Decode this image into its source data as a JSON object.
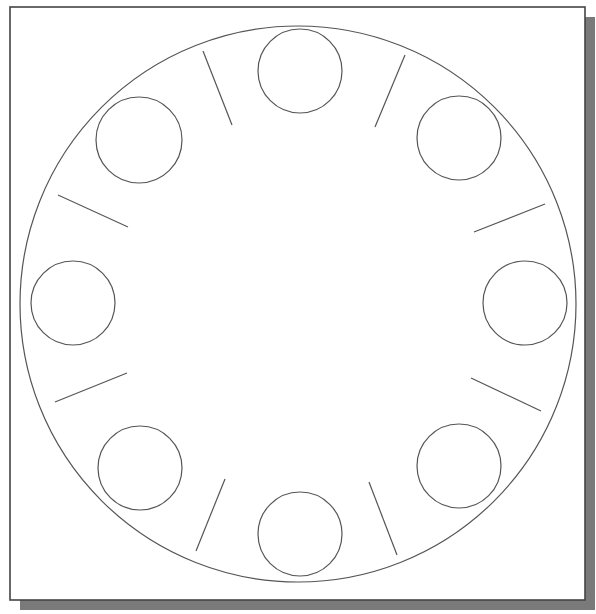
{
  "diagram": {
    "colors": {
      "background": "#ffffff",
      "frame_stroke": "#444444",
      "shadow": "#7a7a7a",
      "line_stroke": "#555555"
    },
    "frame": {
      "x": 10,
      "y": 7,
      "width": 575,
      "height": 593,
      "shadow_offset": 10
    },
    "outer_circle": {
      "cx": 298,
      "cy": 304,
      "r": 278
    },
    "holes": [
      {
        "name": "top",
        "cx": 300,
        "cy": 71,
        "r": 42
      },
      {
        "name": "top-right",
        "cx": 459,
        "cy": 138,
        "r": 42
      },
      {
        "name": "right",
        "cx": 525,
        "cy": 303,
        "r": 42
      },
      {
        "name": "bottom-right",
        "cx": 459,
        "cy": 466,
        "r": 42
      },
      {
        "name": "bottom",
        "cx": 300,
        "cy": 534,
        "r": 42
      },
      {
        "name": "bottom-left",
        "cx": 140,
        "cy": 468,
        "r": 42
      },
      {
        "name": "left",
        "cx": 73,
        "cy": 303,
        "r": 42
      },
      {
        "name": "top-left",
        "cx": 139,
        "cy": 140,
        "r": 43
      }
    ],
    "ticks": [
      {
        "name": "top-left-upper",
        "x1": 203,
        "y1": 51,
        "x2": 232,
        "y2": 125
      },
      {
        "name": "top-right-upper",
        "x1": 405,
        "y1": 55,
        "x2": 375,
        "y2": 127
      },
      {
        "name": "right-upper",
        "x1": 545,
        "y1": 204,
        "x2": 474,
        "y2": 232
      },
      {
        "name": "right-lower",
        "x1": 471,
        "y1": 378,
        "x2": 541,
        "y2": 411
      },
      {
        "name": "bottom-right",
        "x1": 369,
        "y1": 482,
        "x2": 397,
        "y2": 555
      },
      {
        "name": "bottom-left",
        "x1": 225,
        "y1": 479,
        "x2": 196,
        "y2": 551
      },
      {
        "name": "left-lower",
        "x1": 55,
        "y1": 402,
        "x2": 127,
        "y2": 373
      },
      {
        "name": "left-upper",
        "x1": 58,
        "y1": 195,
        "x2": 128,
        "y2": 227
      }
    ]
  }
}
